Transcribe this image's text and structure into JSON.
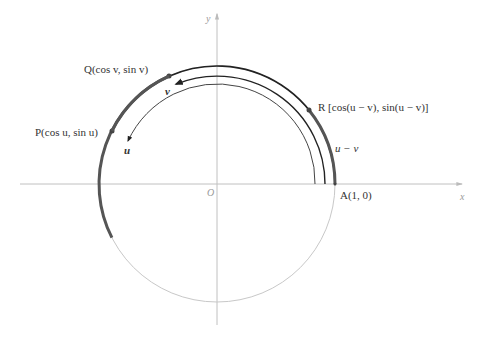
{
  "figure": {
    "type": "unit-circle-difference-identity",
    "axes": {
      "x_label": "x",
      "y_label": "y",
      "origin_label": "O"
    },
    "points": {
      "P": {
        "label": "P(cos u, sin u)",
        "angle_deg": 153
      },
      "Q": {
        "label": "Q(cos v, sin v)",
        "angle_deg": 114
      },
      "R": {
        "label": "R [cos(u − v), sin(u − v)]",
        "angle_deg": 39
      },
      "A": {
        "label": "A(1, 0)",
        "angle_deg": 0
      }
    },
    "arc_labels": {
      "u": "u",
      "v": "v",
      "u_minus_v": "u − v"
    },
    "colors": {
      "circle": "#c8c8c8",
      "axis": "#c0c0c0",
      "arc_dark": "#222222",
      "arc_highlight": "#555555",
      "label": "#333333"
    }
  }
}
